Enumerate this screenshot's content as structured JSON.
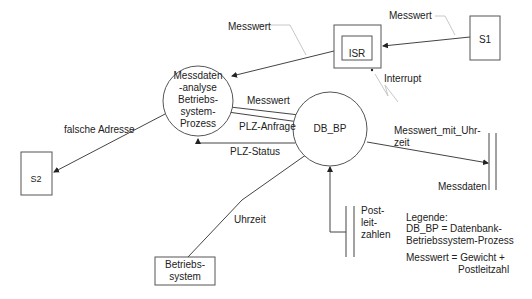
{
  "diagram": {
    "type": "data-flow-diagram",
    "processes": {
      "analysis": {
        "lines": [
          "Messdaten",
          "-analyse",
          "Betriebs-",
          "system-",
          "Prozess"
        ]
      },
      "db_bp": {
        "label": "DB_BP"
      }
    },
    "terminators": {
      "s1": {
        "label": "S1"
      },
      "s2": {
        "label": "S2"
      },
      "os": {
        "lines": [
          "Betriebs-",
          "system"
        ]
      }
    },
    "isr": {
      "label": "ISR"
    },
    "stores": {
      "messdaten": {
        "label": "Messdaten"
      },
      "postleitzahlen": {
        "lines": [
          "Post-",
          "leit-",
          "zahlen"
        ]
      }
    },
    "flows": {
      "s1_to_isr": "Messwert",
      "isr_to_analysis": "Messwert",
      "interrupt": "Interrupt",
      "analysis_to_db_messwert": "Messwert",
      "plz_anfrage": "PLZ-Anfrage",
      "plz_status": "PLZ-Status",
      "falsche_adresse": "falsche Adresse",
      "db_to_messdaten": [
        "Messwert_mit_Uhr-",
        "zeit"
      ],
      "uhrzeit": "Uhrzeit"
    },
    "legend": {
      "title": "Legende:",
      "entry1_line1": "DB_BP = Datenbank-",
      "entry1_line2": "Betriebssystem-Prozess",
      "entry2_line1": "Messwert = Gewicht +",
      "entry2_line2": "Postleitzahl"
    },
    "colors": {
      "background": "#ffffff",
      "stroke": "#555555",
      "annotation": "#c8c8c8",
      "text": "#222222"
    }
  }
}
